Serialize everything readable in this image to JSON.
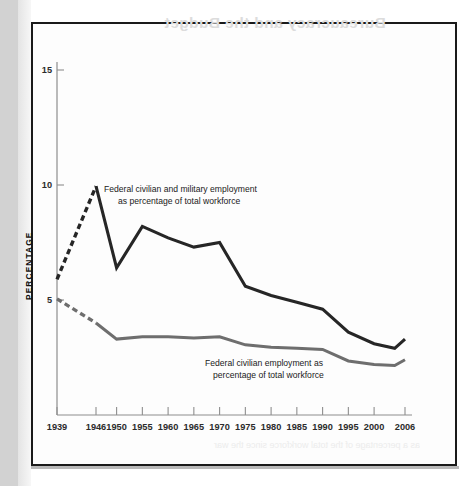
{
  "page": {
    "bleed_through_text": "Bureaucracy and the Budget",
    "bleed_through_text_2": "as a percentage of the total workforce since the war"
  },
  "chart_data": {
    "type": "line",
    "title": "",
    "xlabel": "",
    "ylabel": "PERCENTAGE",
    "xlim": [
      1939,
      2006
    ],
    "ylim": [
      0,
      16
    ],
    "yticks": [
      5,
      10,
      15
    ],
    "ytick_labels": [
      "5",
      "10",
      "15"
    ],
    "xticks": [
      1939,
      1946,
      1950,
      1955,
      1960,
      1965,
      1970,
      1975,
      1980,
      1985,
      1990,
      1995,
      2000,
      2006
    ],
    "xtick_labels": [
      "1939",
      "1946",
      "1950",
      "1955",
      "1960",
      "1965",
      "1970",
      "1975",
      "1980",
      "1985",
      "1990",
      "1995",
      "2000",
      "2006"
    ],
    "grid": false,
    "legend_position": "inline-annotations",
    "series": [
      {
        "name": "Federal civilian and military employment as percentage of total workforce",
        "color": "#262626",
        "style": "solid-with-dashed-lead",
        "dashed_through": 1946,
        "x": [
          1939,
          1946,
          1950,
          1955,
          1960,
          1965,
          1970,
          1975,
          1980,
          1985,
          1990,
          1995,
          2000,
          2004,
          2006
        ],
        "values": [
          5.9,
          9.95,
          6.4,
          8.2,
          7.7,
          7.3,
          7.5,
          5.6,
          5.2,
          4.9,
          4.6,
          3.6,
          3.1,
          2.9,
          3.3
        ]
      },
      {
        "name": "Federal civilian employment as percentage of total workforce",
        "color": "#6e6e6e",
        "style": "solid-with-dashed-lead",
        "dashed_through": 1946,
        "x": [
          1939,
          1946,
          1950,
          1955,
          1960,
          1965,
          1970,
          1975,
          1980,
          1985,
          1990,
          1995,
          2000,
          2004,
          2006
        ],
        "values": [
          5.05,
          4.0,
          3.3,
          3.4,
          3.4,
          3.35,
          3.4,
          3.05,
          2.95,
          2.9,
          2.85,
          2.35,
          2.2,
          2.15,
          2.4
        ]
      }
    ],
    "annotations": [
      {
        "id": "annotation-upper",
        "lines": [
          "Federal civilian and military employment",
          "as percentage of total workforce"
        ]
      },
      {
        "id": "annotation-lower",
        "lines": [
          "Federal civilian employment as",
          "percentage of total workforce"
        ]
      }
    ]
  }
}
